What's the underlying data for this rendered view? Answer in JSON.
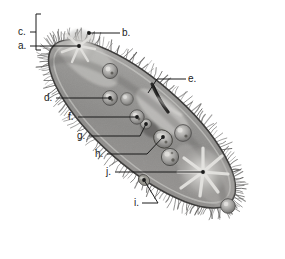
{
  "figure": {
    "style": "grayscale pencil illustration",
    "background_color": "#ffffff",
    "body_fill_color": "#8e8d8c",
    "body_outline_color": "#3a3a3a",
    "cilia_color": "#5a5a5a",
    "leader_line_color": "#1b1b1b",
    "label_text_color": "#1b1b1b"
  },
  "labels": [
    {
      "id": "a",
      "text": "a.",
      "text_x": 18,
      "text_y": 49,
      "line_from_x": 30,
      "line_from_y": 46,
      "line_to_x": 79,
      "line_to_y": 46,
      "dot_x": 79,
      "dot_y": 46,
      "has_dot": true,
      "target": "anterior-contractile-vacuole"
    },
    {
      "id": "b",
      "text": "b.",
      "text_x": 122,
      "text_y": 36,
      "line_from_x": 120,
      "line_from_y": 33,
      "line_to_x": 89,
      "line_to_y": 33,
      "dot_x": 89,
      "dot_y": 33,
      "has_dot": true,
      "target": "pellicle"
    },
    {
      "id": "c",
      "text": "c.",
      "text_x": 18,
      "text_y": 35,
      "line_from_x": 30,
      "line_from_y": 32,
      "line_to_x": 36,
      "line_to_y": 32,
      "dot_x": 0,
      "dot_y": 0,
      "has_dot": false,
      "target": "cilia",
      "bracket": {
        "x": 36,
        "y_top": 14,
        "y_bottom": 50,
        "tick": 5
      }
    },
    {
      "id": "d",
      "text": "d.",
      "text_x": 44,
      "text_y": 101,
      "line_from_x": 56,
      "line_from_y": 98,
      "line_to_x": 110,
      "line_to_y": 98,
      "dot_x": 110,
      "dot_y": 98,
      "has_dot": true,
      "target": "food-vacuole"
    },
    {
      "id": "e",
      "text": "e.",
      "text_x": 188,
      "text_y": 82,
      "line_from_x": 186,
      "line_from_y": 79,
      "line_to_x": 157,
      "line_to_y": 79,
      "dot_x": 0,
      "dot_y": 0,
      "has_dot": false,
      "target": "oral-groove",
      "elbow_x": 148,
      "elbow_y": 93
    },
    {
      "id": "f",
      "text": "f.",
      "text_x": 68,
      "text_y": 120,
      "line_from_x": 78,
      "line_from_y": 117,
      "line_to_x": 137,
      "line_to_y": 117,
      "dot_x": 137,
      "dot_y": 117,
      "has_dot": true,
      "target": "food-vacuole-forming"
    },
    {
      "id": "g",
      "text": "g.",
      "text_x": 77,
      "text_y": 139,
      "line_from_x": 89,
      "line_from_y": 136,
      "line_to_x": 140,
      "line_to_y": 136,
      "dot_x": 146,
      "dot_y": 124,
      "has_dot": true,
      "target": "gullet",
      "elbow_x": 146,
      "elbow_y": 124
    },
    {
      "id": "h",
      "text": "h.",
      "text_x": 95,
      "text_y": 157,
      "line_from_x": 107,
      "line_from_y": 154,
      "line_to_x": 147,
      "line_to_y": 154,
      "dot_x": 163,
      "dot_y": 137,
      "has_dot": true,
      "target": "macronucleus",
      "elbow_x": 163,
      "elbow_y": 137
    },
    {
      "id": "i",
      "text": "i.",
      "text_x": 134,
      "text_y": 206,
      "line_from_x": 142,
      "line_from_y": 203,
      "line_to_x": 158,
      "line_to_y": 203,
      "dot_x": 144,
      "dot_y": 180,
      "has_dot": true,
      "target": "trichocyst",
      "elbow_x": 144,
      "elbow_y": 180
    },
    {
      "id": "j",
      "text": "j.",
      "text_x": 106,
      "text_y": 175,
      "line_from_x": 115,
      "line_from_y": 172,
      "line_to_x": 203,
      "line_to_y": 172,
      "dot_x": 203,
      "dot_y": 172,
      "has_dot": true,
      "target": "posterior-contractile-vacuole"
    }
  ],
  "organelles": [
    {
      "name": "anterior-contractile-vacuole",
      "cx": 79,
      "cy": 46,
      "r": 16,
      "kind": "star"
    },
    {
      "name": "posterior-contractile-vacuole",
      "cx": 203,
      "cy": 172,
      "r": 21,
      "kind": "star"
    },
    {
      "name": "food-vacuole-1",
      "cx": 110,
      "cy": 71,
      "r": 7,
      "kind": "vacuole"
    },
    {
      "name": "food-vacuole-2",
      "cx": 110,
      "cy": 98,
      "r": 7,
      "kind": "vacuole"
    },
    {
      "name": "food-vacuole-3",
      "cx": 126,
      "cy": 99,
      "r": 6,
      "kind": "vacuole"
    },
    {
      "name": "food-vacuole-4",
      "cx": 137,
      "cy": 117,
      "r": 7,
      "kind": "vacuole"
    },
    {
      "name": "food-vacuole-5",
      "cx": 147,
      "cy": 124,
      "r": 5,
      "kind": "vacuole"
    },
    {
      "name": "food-vacuole-6",
      "cx": 183,
      "cy": 133,
      "r": 8,
      "kind": "vacuole"
    },
    {
      "name": "food-vacuole-7",
      "cx": 170,
      "cy": 157,
      "r": 8,
      "kind": "vacuole"
    },
    {
      "name": "food-vacuole-8",
      "cx": 228,
      "cy": 206,
      "r": 7,
      "kind": "vacuole"
    },
    {
      "name": "macronucleus",
      "cx": 163,
      "cy": 138,
      "r": 9,
      "kind": "nucleus"
    },
    {
      "name": "oral-groove",
      "x1": 152,
      "y1": 86,
      "x2": 170,
      "y2": 113,
      "kind": "groove"
    }
  ]
}
